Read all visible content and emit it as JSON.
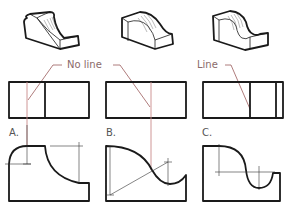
{
  "diagram": {
    "callouts": {
      "no_line": "No line",
      "line": "Line"
    },
    "labels": {
      "a": "A.",
      "b": "B.",
      "c": "C."
    },
    "rows": [
      "isometric-views",
      "top-views",
      "front-profile-views"
    ],
    "colors": {
      "object_line": "#1a1a1a",
      "projection_line": "#c98a8a",
      "leader_line": "#9a5a5a",
      "label_text": "#8a6a6a"
    }
  }
}
